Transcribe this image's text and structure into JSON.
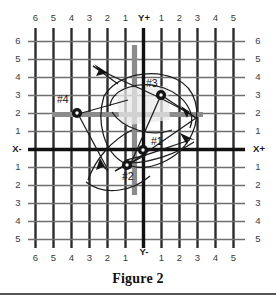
{
  "figure": {
    "caption": "Figure 2",
    "axis_labels": {
      "x_negative": "X-",
      "x_positive": "X+",
      "y_positive": "Y+",
      "y_negative": "Y-"
    },
    "ticks": {
      "top": [
        "6",
        "5",
        "4",
        "3",
        "2",
        "1",
        "Y+",
        "1",
        "2",
        "3",
        "4",
        "5"
      ],
      "bottom": [
        "6",
        "5",
        "4",
        "3",
        "2",
        "1",
        "Y-",
        "1",
        "2",
        "3",
        "4",
        "5"
      ],
      "left": [
        "6",
        "5",
        "4",
        "3",
        "2",
        "1",
        "X-",
        "1",
        "2",
        "3",
        "4",
        "5"
      ],
      "right": [
        "6",
        "5",
        "4",
        "3",
        "2",
        "1",
        "X+",
        "1",
        "2",
        "3",
        "4",
        "5"
      ]
    },
    "colors": {
      "grid_vertical": "#2b2b2b",
      "grid_horizontal": "#6f6f6f",
      "axis": "#111111",
      "overlay_bar": "#8c8c8c",
      "marker": "#141414",
      "curve": "#1c1c1c",
      "page_background": "#ffffff",
      "label_text": "#3a3a3a"
    },
    "points": [
      {
        "id": "#1",
        "label": "#1",
        "x": 0.6,
        "y": -0.1,
        "label_dx": 9,
        "label_dy": -7
      },
      {
        "id": "#2",
        "label": "#2",
        "x": -0.5,
        "y": -1.0,
        "label_dx": 2,
        "label_dy": 11
      },
      {
        "id": "#3",
        "label": "#3",
        "x": 1.0,
        "y": 3.0,
        "label_dx": -14,
        "label_dy": -10
      },
      {
        "id": "#4",
        "label": "#4",
        "x": -4.0,
        "y": 2.0,
        "label_dx": -20,
        "label_dy": -11
      }
    ],
    "overlay_bars": [
      {
        "name": "horizontal-gray-bar",
        "orientation": "horizontal",
        "x_start": -5.6,
        "x_end": 3.3,
        "y": 1.7,
        "thickness": 5
      },
      {
        "name": "vertical-gray-bar",
        "orientation": "vertical",
        "y_start": 5.3,
        "y_end": -2.8,
        "x": -0.55,
        "thickness": 5
      }
    ],
    "grid": {
      "x_min": -6,
      "x_max": 5,
      "y_min": -5,
      "y_max": 6,
      "step": 1
    }
  }
}
